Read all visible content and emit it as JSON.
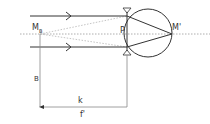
{
  "diagram": {
    "type": "optics-eye-focal",
    "labels": {
      "mb": "M",
      "mb_sub": "B",
      "p": "P",
      "m_prime": "M'",
      "b": "B",
      "k": "k",
      "f_prime": "f'"
    },
    "colors": {
      "line": "#333333",
      "dotted": "#999999",
      "dim": "#888888"
    }
  }
}
